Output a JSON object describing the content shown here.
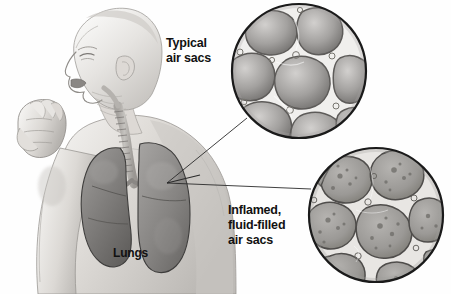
{
  "illustration": {
    "title": "Pneumonia air sac comparison",
    "subject": "coughing man with lungs and magnified alveoli",
    "background_color": "#fefefe",
    "text_color": "#111111",
    "style": "grayscale medical illustration"
  },
  "labels": {
    "typical_air_sacs": "Typical\nair sacs",
    "inflamed_air_sacs": "Inflamed,\nfluid-filled\nair sacs",
    "lungs": "Lungs"
  },
  "figure": {
    "name": "coughing-man",
    "pose": "profile facing left, fist raised to mouth",
    "skin_light": "#f2f1ef",
    "skin_mid": "#d9d7d4",
    "skin_shadow": "#b4b1ad",
    "outline": "#8d8a86"
  },
  "lungs": {
    "name": "lungs-anatomy",
    "fill_dark": "#6f6d6b",
    "fill_mid": "#8b8987",
    "fill_light": "#a6a4a2",
    "outline": "#3e3d3c",
    "trachea_fill": "#cfcdc9",
    "trachea_outline": "#6e6c69"
  },
  "insets": [
    {
      "name": "typical-air-sacs-inset",
      "cx": 299,
      "cy": 71,
      "r": 68,
      "ring_color": "#1a1a1a",
      "wall_color": "#efeeec",
      "wall_outline": "#5d5b59",
      "sac_fill_center": "#c9c7c5",
      "sac_fill_edge": "#73716f",
      "speckled": false,
      "sac_count": 9
    },
    {
      "name": "inflamed-air-sacs-inset",
      "cx": 376,
      "cy": 215,
      "r": 68,
      "ring_color": "#1a1a1a",
      "wall_color": "#e6e4e1",
      "wall_outline": "#4f4d4b",
      "sac_fill_center": "#a9a7a4",
      "sac_fill_edge": "#7c7a77",
      "speckled": true,
      "sac_count": 9
    }
  ],
  "leader_lines": {
    "name": "leader-lines",
    "color": "#2a2a2a",
    "width": 0.9,
    "origin": {
      "x": 167,
      "y": 183
    },
    "targets": [
      {
        "to_inset": "typical-air-sacs-inset",
        "x": 247,
        "y": 118
      },
      {
        "to_inset": "inflamed-air-sacs-inset",
        "x": 311,
        "y": 189
      }
    ]
  }
}
